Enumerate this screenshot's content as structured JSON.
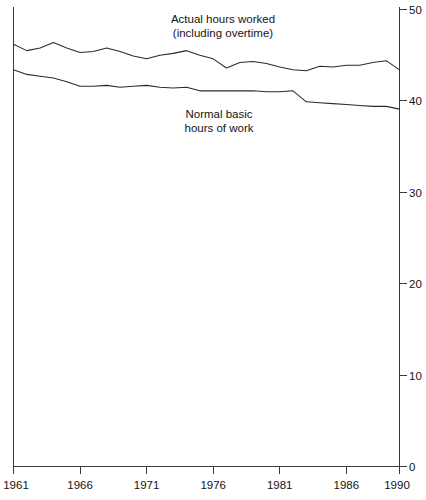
{
  "chart_data": {
    "type": "line",
    "title": "",
    "xlabel": "",
    "ylabel": "",
    "xlim": [
      1961,
      1990
    ],
    "ylim": [
      0,
      50
    ],
    "grid": false,
    "legend_position": "inline-annotations",
    "x": [
      1961,
      1962,
      1963,
      1964,
      1965,
      1966,
      1967,
      1968,
      1969,
      1970,
      1971,
      1972,
      1973,
      1974,
      1975,
      1976,
      1977,
      1978,
      1979,
      1980,
      1981,
      1982,
      1983,
      1984,
      1985,
      1986,
      1987,
      1988,
      1989,
      1990
    ],
    "xticks": [
      1961,
      1966,
      1971,
      1976,
      1981,
      1986,
      1990
    ],
    "xtick_labels": [
      "1961",
      "1966",
      "1971",
      "1976",
      "1981",
      "1986",
      "1990"
    ],
    "yticks": [
      0,
      10,
      20,
      30,
      40,
      50
    ],
    "ytick_labels": [
      "0",
      "10",
      "20",
      "30",
      "40",
      "50"
    ],
    "yaxis_side": "right",
    "series": [
      {
        "name": "Actual hours worked (including overtime)",
        "values": [
          46.2,
          45.5,
          45.8,
          46.4,
          45.8,
          45.3,
          45.4,
          45.8,
          45.4,
          44.9,
          44.6,
          45.0,
          45.2,
          45.5,
          45.0,
          44.6,
          43.6,
          44.2,
          44.3,
          44.1,
          43.7,
          43.4,
          43.3,
          43.8,
          43.7,
          43.9,
          43.9,
          44.2,
          44.4,
          43.4
        ],
        "annotation": {
          "line1": "Actual hours worked",
          "line2": "(including overtime)"
        }
      },
      {
        "name": "Normal basic hours of work",
        "values": [
          43.4,
          42.9,
          42.7,
          42.5,
          42.1,
          41.6,
          41.6,
          41.7,
          41.5,
          41.6,
          41.7,
          41.5,
          41.4,
          41.5,
          41.1,
          41.1,
          41.1,
          41.1,
          41.1,
          41.0,
          41.0,
          41.1,
          39.9,
          39.8,
          39.7,
          39.6,
          39.5,
          39.4,
          39.4,
          39.1
        ],
        "annotation": {
          "line1": "Normal basic",
          "line2": "hours of work"
        }
      }
    ],
    "colors": {
      "line": "#2b2b2b",
      "axis": "#3a3a3a",
      "text": "#141414",
      "background": "#ffffff"
    }
  },
  "annotations": {
    "actual": {
      "line1": "Actual hours worked",
      "line2": "(including overtime)"
    },
    "basic": {
      "line1": "Normal basic",
      "line2": "hours of work"
    }
  },
  "axes": {
    "y_labels": [
      "50",
      "40",
      "30",
      "20",
      "10",
      "0"
    ],
    "x_labels": [
      "1961",
      "1966",
      "1971",
      "1976",
      "1981",
      "1986",
      "1990"
    ]
  }
}
